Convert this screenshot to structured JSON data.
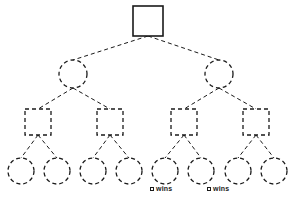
{
  "diagram": {
    "type": "game-tree",
    "title": "",
    "background_color": "#ffffff",
    "stroke_color": "#1a1a1a",
    "width": 293,
    "height": 203,
    "levels": [
      {
        "index": 0,
        "shape": "square",
        "line_style": "solid",
        "player": "square",
        "nodes": [
          {
            "id": "n0",
            "cx": 148,
            "cy": 21,
            "size": 30
          }
        ]
      },
      {
        "index": 1,
        "shape": "circle",
        "line_style": "dashed",
        "player": "circle",
        "nodes": [
          {
            "id": "n1",
            "cx": 73,
            "cy": 74,
            "r": 14
          },
          {
            "id": "n2",
            "cx": 219,
            "cy": 74,
            "r": 14
          }
        ]
      },
      {
        "index": 2,
        "shape": "square",
        "line_style": "dashed",
        "player": "square",
        "nodes": [
          {
            "id": "n3",
            "cx": 38,
            "cy": 122,
            "size": 26
          },
          {
            "id": "n4",
            "cx": 110,
            "cy": 122,
            "size": 26
          },
          {
            "id": "n5",
            "cx": 184,
            "cy": 122,
            "size": 26
          },
          {
            "id": "n6",
            "cx": 256,
            "cy": 122,
            "size": 26
          }
        ]
      },
      {
        "index": 3,
        "shape": "circle",
        "line_style": "dashed",
        "player": "circle",
        "nodes": [
          {
            "id": "n7",
            "cx": 21,
            "cy": 171,
            "r": 13
          },
          {
            "id": "n8",
            "cx": 57,
            "cy": 171,
            "r": 13
          },
          {
            "id": "n9",
            "cx": 93,
            "cy": 171,
            "r": 13
          },
          {
            "id": "n10",
            "cx": 129,
            "cy": 171,
            "r": 13
          },
          {
            "id": "n11",
            "cx": 165,
            "cy": 171,
            "r": 13
          },
          {
            "id": "n12",
            "cx": 201,
            "cy": 171,
            "r": 13
          },
          {
            "id": "n13",
            "cx": 238,
            "cy": 171,
            "r": 13
          },
          {
            "id": "n14",
            "cx": 274,
            "cy": 171,
            "r": 13
          }
        ]
      }
    ],
    "edges": [
      {
        "from": "n0",
        "to": "n1",
        "x1": 148,
        "y1": 36,
        "x2": 73,
        "y2": 60
      },
      {
        "from": "n0",
        "to": "n2",
        "x1": 148,
        "y1": 36,
        "x2": 219,
        "y2": 60
      },
      {
        "from": "n1",
        "to": "n3",
        "x1": 73,
        "y1": 88,
        "x2": 38,
        "y2": 109
      },
      {
        "from": "n1",
        "to": "n4",
        "x1": 73,
        "y1": 88,
        "x2": 110,
        "y2": 109
      },
      {
        "from": "n2",
        "to": "n5",
        "x1": 219,
        "y1": 88,
        "x2": 184,
        "y2": 109
      },
      {
        "from": "n2",
        "to": "n6",
        "x1": 219,
        "y1": 88,
        "x2": 256,
        "y2": 109
      },
      {
        "from": "n3",
        "to": "n7",
        "x1": 38,
        "y1": 135,
        "x2": 21,
        "y2": 158
      },
      {
        "from": "n3",
        "to": "n8",
        "x1": 38,
        "y1": 135,
        "x2": 57,
        "y2": 158
      },
      {
        "from": "n4",
        "to": "n9",
        "x1": 110,
        "y1": 135,
        "x2": 93,
        "y2": 158
      },
      {
        "from": "n4",
        "to": "n10",
        "x1": 110,
        "y1": 135,
        "x2": 129,
        "y2": 158
      },
      {
        "from": "n5",
        "to": "n11",
        "x1": 184,
        "y1": 135,
        "x2": 165,
        "y2": 158
      },
      {
        "from": "n5",
        "to": "n12",
        "x1": 184,
        "y1": 135,
        "x2": 201,
        "y2": 158
      },
      {
        "from": "n6",
        "to": "n13",
        "x1": 256,
        "y1": 135,
        "x2": 238,
        "y2": 158
      },
      {
        "from": "n6",
        "to": "n14",
        "x1": 256,
        "y1": 135,
        "x2": 274,
        "y2": 158
      }
    ],
    "annotations": [
      {
        "id": "a1",
        "glyph": "square-glyph",
        "text": "wins",
        "full_text": "□ wins",
        "x": 150,
        "y": 185,
        "attached_to": "n11"
      },
      {
        "id": "a2",
        "glyph": "square-glyph",
        "text": "wins",
        "full_text": "□ wins",
        "x": 207,
        "y": 185,
        "attached_to": "n13"
      }
    ]
  }
}
